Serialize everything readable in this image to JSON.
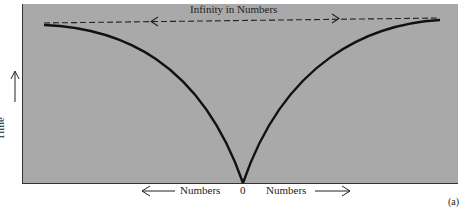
{
  "diagram": {
    "title": "Infinity in Numbers",
    "y_axis_label": "Time",
    "x_axis_left_label": "Numbers",
    "x_axis_center_label": "0",
    "x_axis_right_label": "Numbers",
    "figure_tag": "(a)",
    "colors": {
      "panel_background": "#a9a9a9",
      "curve": "#111111",
      "page_background": "#ffffff"
    },
    "elements": [
      {
        "type": "dashed-double-arrow",
        "label": "Infinity in Numbers",
        "from": "left-curve-top",
        "to": "right-curve-top"
      },
      {
        "type": "curve",
        "description": "left branch descending from top-left to origin 0"
      },
      {
        "type": "curve",
        "description": "right branch descending from top-right to origin 0"
      },
      {
        "type": "arrow",
        "direction": "up",
        "label": "Time"
      },
      {
        "type": "arrow",
        "direction": "left",
        "label": "Numbers"
      },
      {
        "type": "arrow",
        "direction": "right",
        "label": "Numbers"
      }
    ]
  }
}
